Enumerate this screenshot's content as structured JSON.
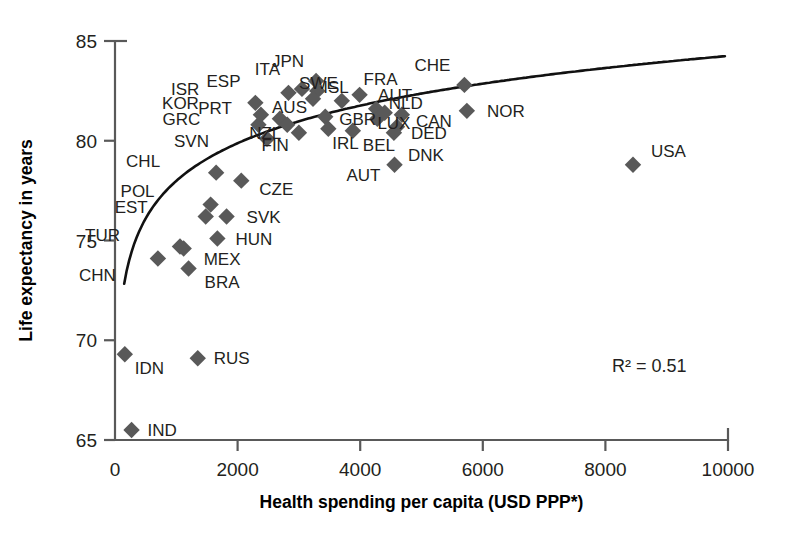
{
  "chart_data": {
    "type": "scatter",
    "title": "",
    "xlabel": "Health spending per capita (USD PPP*)",
    "ylabel": "Life expectancy in years",
    "xlim": [
      0,
      10000
    ],
    "ylim": [
      65,
      85
    ],
    "xticks": [
      "0",
      "2000",
      "4000",
      "6000",
      "8000",
      "10000"
    ],
    "xtick_values": [
      0,
      2000,
      4000,
      6000,
      8000,
      10000
    ],
    "yticks": [
      "65",
      "70",
      "75",
      "80",
      "85"
    ],
    "ytick_values": [
      65,
      70,
      75,
      80,
      85
    ],
    "grid": false,
    "legend": "none",
    "annotation": "R² = 0.51",
    "annotation_value": 0.51,
    "trendline": {
      "type": "logarithmic",
      "description": "fitted logarithmic curve rising steeply from low spending then flattening"
    },
    "marker_shape": "diamond",
    "marker_color": "#595959",
    "points": [
      {
        "label": "IND",
        "x": 270,
        "y": 65.5,
        "label_dx": 16,
        "label_dy": 6
      },
      {
        "label": "IDN",
        "x": 160,
        "y": 69.3,
        "label_dx": 10,
        "label_dy": 20
      },
      {
        "label": "RUS",
        "x": 1350,
        "y": 69.1,
        "label_dx": 16,
        "label_dy": 6
      },
      {
        "label": "CHN",
        "x": 700,
        "y": 74.1,
        "label_dx": -42,
        "label_dy": 22
      },
      {
        "label": "BRA",
        "x": 1200,
        "y": 73.6,
        "label_dx": 16,
        "label_dy": 20
      },
      {
        "label": "TUR",
        "x": 1060,
        "y": 74.7,
        "label_dx": -60,
        "label_dy": -6
      },
      {
        "label": "MEX",
        "x": 1120,
        "y": 74.6,
        "label_dx": 20,
        "label_dy": 16
      },
      {
        "label": "HUN",
        "x": 1670,
        "y": 75.1,
        "label_dx": 18,
        "label_dy": 6
      },
      {
        "label": "EST",
        "x": 1480,
        "y": 76.2,
        "label_dx": -58,
        "label_dy": -4
      },
      {
        "label": "SVK",
        "x": 1820,
        "y": 76.2,
        "label_dx": 20,
        "label_dy": 6
      },
      {
        "label": "POL",
        "x": 1560,
        "y": 76.8,
        "label_dx": -56,
        "label_dy": -8
      },
      {
        "label": "CHL",
        "x": 1650,
        "y": 78.4,
        "label_dx": -56,
        "label_dy": -6
      },
      {
        "label": "CZE",
        "x": 2060,
        "y": 78.0,
        "label_dx": 18,
        "label_dy": 14
      },
      {
        "label": "SVN",
        "x": 2480,
        "y": 80.1,
        "label_dx": -58,
        "label_dy": 8
      },
      {
        "label": "GRC",
        "x": 2340,
        "y": 80.8,
        "label_dx": -58,
        "label_dy": 0
      },
      {
        "label": "KOR",
        "x": 2380,
        "y": 81.3,
        "label_dx": -62,
        "label_dy": -6
      },
      {
        "label": "ISR",
        "x": 2290,
        "y": 81.9,
        "label_dx": -56,
        "label_dy": -8
      },
      {
        "label": "PRT",
        "x": 2690,
        "y": 81.1,
        "label_dx": -48,
        "label_dy": -5
      },
      {
        "label": "ESP",
        "x": 2830,
        "y": 82.4,
        "label_dx": -48,
        "label_dy": -6
      },
      {
        "label": "NZL",
        "x": 2810,
        "y": 80.8,
        "label_dx": -6,
        "label_dy": 14
      },
      {
        "label": "ITA",
        "x": 3050,
        "y": 82.6,
        "label_dx": -22,
        "label_dy": -14
      },
      {
        "label": "FIN",
        "x": 3000,
        "y": 80.4,
        "label_dx": -10,
        "label_dy": 18
      },
      {
        "label": "JPN",
        "x": 3280,
        "y": 83.0,
        "label_dx": -12,
        "label_dy": -14
      },
      {
        "label": "ISL",
        "x": 3300,
        "y": 82.5,
        "label_dx": 6,
        "label_dy": 2
      },
      {
        "label": "AUS",
        "x": 3230,
        "y": 82.1,
        "label_dx": -6,
        "label_dy": 14
      },
      {
        "label": "GBR",
        "x": 3430,
        "y": 81.2,
        "label_dx": 14,
        "label_dy": 8
      },
      {
        "label": "IRL",
        "x": 3480,
        "y": 80.6,
        "label_dx": 4,
        "label_dy": 20
      },
      {
        "label": "SWE",
        "x": 3700,
        "y": 82.0,
        "label_dx": -4,
        "label_dy": -12
      },
      {
        "label": "BEL",
        "x": 3880,
        "y": 80.5,
        "label_dx": 10,
        "label_dy": 20
      },
      {
        "label": "FRA",
        "x": 3990,
        "y": 82.3,
        "label_dx": 4,
        "label_dy": -10
      },
      {
        "label": "AUT",
        "x": 4260,
        "y": 81.6,
        "label_dx": 2,
        "label_dy": -8
      },
      {
        "label": "LUX",
        "x": 4280,
        "y": 81.1,
        "label_dx": 0,
        "label_dy": 10
      },
      {
        "label": "DED",
        "x": 4600,
        "y": 80.7,
        "label_dx": 14,
        "label_dy": 12
      },
      {
        "label": "DNK",
        "x": 4550,
        "y": 80.4,
        "label_dx": 14,
        "label_dy": 28
      },
      {
        "label": "NLD",
        "x": 4400,
        "y": 81.4,
        "label_dx": 4,
        "label_dy": -4
      },
      {
        "label": "CAN",
        "x": 4680,
        "y": 81.3,
        "label_dx": 14,
        "label_dy": 12
      },
      {
        "label": "AUT",
        "x": 4560,
        "y": 78.8,
        "label_dx": -14,
        "label_dy": 16
      },
      {
        "label": "CHE",
        "x": 5700,
        "y": 82.8,
        "label_dx": -14,
        "label_dy": -14
      },
      {
        "label": "NOR",
        "x": 5740,
        "y": 81.5,
        "label_dx": 20,
        "label_dy": 6
      },
      {
        "label": "USA",
        "x": 8450,
        "y": 78.8,
        "label_dx": 18,
        "label_dy": -8
      }
    ]
  },
  "colors": {
    "marker": "#595959",
    "axis": "#595959",
    "text": "#231f20",
    "trendline": "#111111",
    "background": "#ffffff"
  }
}
